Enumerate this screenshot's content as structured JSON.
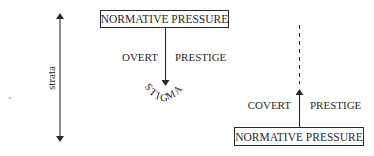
{
  "diagram": {
    "axis_label": "strata",
    "top_box": {
      "label": "NORMATIVE PRESSURE"
    },
    "top_arrow": {
      "left_label": "OVERT",
      "right_label": "PRESTIGE",
      "direction": "down"
    },
    "stigma": {
      "letters": [
        "S",
        "T",
        "I",
        "G",
        "M",
        "A"
      ],
      "word": "STIGMA"
    },
    "bottom_box": {
      "label": "NORMATIVE PRESSURE"
    },
    "bottom_arrow": {
      "left_label": "COVERT",
      "right_label": "PRESTIGE",
      "direction": "up"
    },
    "colors": {
      "ink": "#2a2a2a",
      "background": "#ffffff"
    }
  }
}
